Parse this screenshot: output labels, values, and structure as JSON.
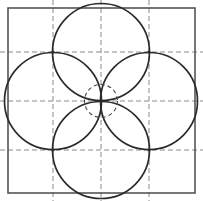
{
  "figure": {
    "type": "geometric-line-drawing",
    "canvas": {
      "width": 203,
      "height": 201,
      "background": "#ffffff"
    },
    "colors": {
      "stroke": "#2b2b2b",
      "border": "#555555",
      "guide": "#8a8a8a",
      "background": "#ffffff"
    },
    "square": {
      "label": "bounding-square",
      "x": 8,
      "y": 8,
      "width": 187,
      "height": 185,
      "stroke_width": 1.6
    },
    "grid": {
      "label": "dashed-construction-grid",
      "vertical_x": [
        53,
        101,
        149
      ],
      "horizontal_y": [
        52,
        101,
        150
      ],
      "dash": "5,3",
      "stroke_width": 1
    },
    "petal_circles": {
      "label": "four-overlapping-circles",
      "radius": 48.5,
      "stroke_width": 1.7,
      "centers": [
        {
          "name": "top-circle",
          "cx": 101,
          "cy": 52
        },
        {
          "name": "bottom-circle",
          "cx": 101,
          "cy": 150
        },
        {
          "name": "left-circle",
          "cx": 53,
          "cy": 101
        },
        {
          "name": "right-circle",
          "cx": 149,
          "cy": 101
        }
      ]
    },
    "center_circle": {
      "label": "central-dashed-circle",
      "cx": 101,
      "cy": 101,
      "r": 16.5,
      "dash": "4,3",
      "stroke_width": 1.1
    },
    "nodes": [
      {
        "name": "node-top-apex",
        "x": 101,
        "y": 8
      },
      {
        "name": "node-bottom-apex",
        "x": 101,
        "y": 193
      },
      {
        "name": "node-left-apex",
        "x": 10,
        "y": 101
      },
      {
        "name": "node-right-apex",
        "x": 193,
        "y": 101
      },
      {
        "name": "node-upper-left",
        "x": 53,
        "y": 52
      },
      {
        "name": "node-upper-right",
        "x": 149,
        "y": 52
      },
      {
        "name": "node-lower-left",
        "x": 53,
        "y": 150
      },
      {
        "name": "node-lower-right",
        "x": 149,
        "y": 150
      }
    ]
  }
}
